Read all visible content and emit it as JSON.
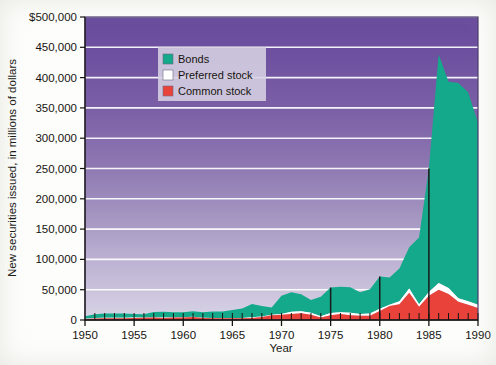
{
  "chart_data": {
    "type": "area",
    "title": "",
    "subtitle": "",
    "xlabel": "Year",
    "ylabel": "New securities issued, in millions of dollars",
    "stacked": true,
    "grid": true,
    "legend_position": "top-left-inside",
    "xlim": [
      1950,
      1990
    ],
    "ylim": [
      0,
      500000
    ],
    "xticks": [
      1950,
      1955,
      1960,
      1965,
      1970,
      1975,
      1980,
      1985,
      1990
    ],
    "xtick_labels": [
      "1950",
      "1955",
      "1960",
      "1965",
      "1970",
      "1975",
      "1980",
      "1985",
      "1990"
    ],
    "yticks": [
      0,
      50000,
      100000,
      150000,
      200000,
      250000,
      300000,
      350000,
      400000,
      450000,
      500000
    ],
    "ytick_labels": [
      "0",
      "50,000",
      "100,000",
      "150,000",
      "200,000",
      "250,000",
      "300,000",
      "350,000",
      "400,000",
      "450,000",
      "$500,000"
    ],
    "x": [
      1950,
      1951,
      1952,
      1953,
      1954,
      1955,
      1956,
      1957,
      1958,
      1959,
      1960,
      1961,
      1962,
      1963,
      1964,
      1965,
      1966,
      1967,
      1968,
      1969,
      1970,
      1971,
      1972,
      1973,
      1974,
      1975,
      1976,
      1977,
      1978,
      1979,
      1980,
      1981,
      1982,
      1983,
      1984,
      1985,
      1986,
      1987,
      1988,
      1989,
      1990
    ],
    "series": [
      {
        "name": "Common stock",
        "color": "#e8423a",
        "values": [
          1500,
          2500,
          2700,
          2900,
          2800,
          3500,
          3700,
          4000,
          3500,
          4000,
          4200,
          5000,
          3200,
          3000,
          2900,
          3000,
          3000,
          3500,
          5000,
          8000,
          8500,
          10000,
          11000,
          8500,
          4000,
          8000,
          10000,
          8000,
          7000,
          7000,
          15000,
          23000,
          26000,
          45000,
          22000,
          40000,
          50000,
          43000,
          30000,
          25000,
          20000
        ]
      },
      {
        "name": "Preferred stock",
        "color": "#ffffff",
        "values": [
          700,
          900,
          900,
          900,
          900,
          700,
          600,
          600,
          600,
          600,
          500,
          500,
          500,
          400,
          400,
          500,
          500,
          900,
          700,
          700,
          1400,
          3700,
          3300,
          3400,
          2200,
          3500,
          2800,
          3900,
          2800,
          3600,
          3600,
          2000,
          5000,
          7000,
          4000,
          6000,
          11000,
          10000,
          6000,
          6000,
          5000
        ]
      },
      {
        "name": "Bonds",
        "color": "#13a98a",
        "values": [
          4000,
          6000,
          7000,
          7000,
          7000,
          5500,
          5000,
          8500,
          9500,
          8000,
          8000,
          9000,
          9000,
          10500,
          10800,
          13000,
          15500,
          22000,
          17500,
          12000,
          30000,
          32000,
          28000,
          21000,
          32000,
          42000,
          42000,
          42000,
          36000,
          40000,
          53000,
          45000,
          54000,
          68000,
          110000,
          204000,
          377000,
          340000,
          355000,
          345000,
          300000
        ]
      }
    ],
    "peak_annotation": {
      "year": 1986,
      "total": 438000
    },
    "marker_lines": [
      1975,
      1980,
      1985
    ]
  },
  "legend": {
    "items": [
      {
        "label": "Bonds",
        "color": "#13a98a"
      },
      {
        "label": "Preferred stock",
        "color": "#ffffff"
      },
      {
        "label": "Common stock",
        "color": "#e8423a"
      }
    ]
  },
  "colors": {
    "plot_bg_top": "#6b4f9e",
    "plot_bg_bottom": "#d8d2e6",
    "gridline": "#ffffff",
    "bonds": "#13a98a",
    "preferred_stock": "#ffffff",
    "common_stock": "#e8423a",
    "axis_text": "#16140f",
    "marker_line": "#1a1a1a"
  }
}
